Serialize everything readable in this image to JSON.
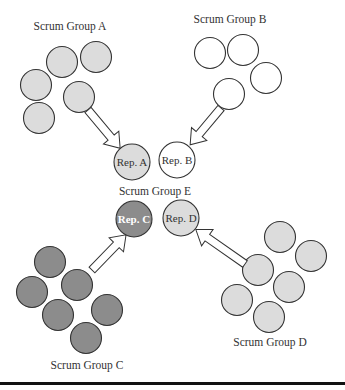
{
  "colors": {
    "group_a_fill": "#dcdcdc",
    "group_b_fill": "#ffffff",
    "group_c_fill": "#8c8c8c",
    "group_d_fill": "#dcdcdc",
    "stroke": "#333333",
    "bottom_rule": "#111111"
  },
  "groups": {
    "a": {
      "label": "Scrum Group A",
      "members": [
        [
          62,
          62
        ],
        [
          96,
          57
        ],
        [
          36,
          85
        ],
        [
          79,
          97
        ],
        [
          39,
          118
        ]
      ],
      "rep": {
        "label": "Rep. A",
        "cx": 132,
        "cy": 162
      }
    },
    "b": {
      "label": "Scrum Group B",
      "members": [
        [
          210,
          53
        ],
        [
          243,
          50
        ],
        [
          266,
          78
        ],
        [
          229,
          94
        ]
      ],
      "rep": {
        "label": "Rep. B",
        "cx": 177,
        "cy": 160
      }
    },
    "c": {
      "label": "Scrum Group C",
      "members": [
        [
          50,
          262
        ],
        [
          77,
          285
        ],
        [
          32,
          292
        ],
        [
          58,
          315
        ],
        [
          107,
          310
        ],
        [
          86,
          338
        ]
      ],
      "rep": {
        "label": "Rep. C",
        "cx": 134,
        "cy": 219
      }
    },
    "d": {
      "label": "Scrum Group D",
      "members": [
        [
          280,
          237
        ],
        [
          311,
          256
        ],
        [
          258,
          270
        ],
        [
          289,
          287
        ],
        [
          237,
          300
        ],
        [
          269,
          317
        ]
      ],
      "rep": {
        "label": "Rep. D",
        "cx": 181,
        "cy": 218
      }
    },
    "e": {
      "label": "Scrum Group E"
    }
  }
}
